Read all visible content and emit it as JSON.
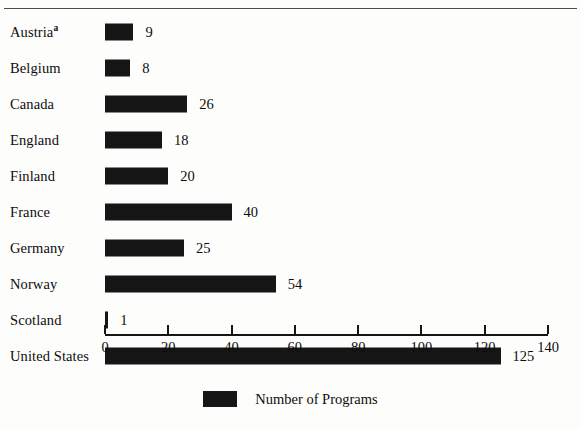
{
  "chart_data": {
    "type": "bar",
    "orientation": "horizontal",
    "title": "",
    "subtitle": "",
    "xlabel": "",
    "ylabel": "",
    "categories": [
      "Austria",
      "Belgium",
      "Canada",
      "England",
      "Finland",
      "France",
      "Germany",
      "Norway",
      "Scotland",
      "United States"
    ],
    "category_footnotes": {
      "Austria": "a"
    },
    "values": [
      9,
      8,
      26,
      18,
      20,
      40,
      25,
      54,
      1,
      125
    ],
    "value_labels": [
      "9",
      "8",
      "26",
      "18",
      "20",
      "40",
      "25",
      "54",
      "1",
      "125"
    ],
    "xlim": [
      0,
      140
    ],
    "xticks": [
      0,
      20,
      40,
      60,
      80,
      100,
      120,
      140
    ],
    "xticklabels": [
      "0",
      "20",
      "40",
      "60",
      "80",
      "100",
      "120",
      "140"
    ],
    "grid": false,
    "legend": {
      "position": "bottom-center",
      "entries": [
        {
          "label": "Number of Programs",
          "color": "#161616"
        }
      ]
    },
    "colors": {
      "bar": "#161616",
      "axis": "#161616",
      "text": "#0d0d0d",
      "background": "#fdfdfc",
      "rule": "#4b4b4b"
    }
  }
}
